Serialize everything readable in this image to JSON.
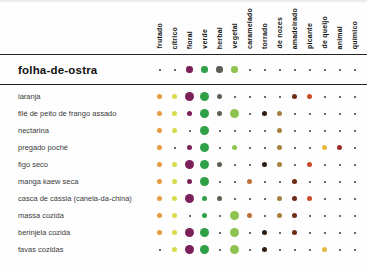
{
  "chart_data": {
    "type": "heatmap",
    "title": "folha-de-ostra",
    "legend_note": "dot size = flavor intensity",
    "size_legend": {
      "t": "trace",
      "s": "present",
      "m": "moderate",
      "l": "strong"
    },
    "dot_scale_px": {
      "t": 2,
      "s": 5,
      "m": 6.5,
      "l": 9
    },
    "trace_color": "#3a3a3a",
    "columns": [
      {
        "label": "frutado",
        "color": "#E79A3F"
      },
      {
        "label": "cítrico",
        "color": "#D9DB4B"
      },
      {
        "label": "floral",
        "color": "#7B2058"
      },
      {
        "label": "verde",
        "color": "#2FA047"
      },
      {
        "label": "herbal",
        "color": "#5E5E55"
      },
      {
        "label": "vegetal",
        "color": "#8FC350"
      },
      {
        "label": "caramelado",
        "color": "#C06F38"
      },
      {
        "label": "torrado",
        "color": "#2E1D12"
      },
      {
        "label": "de nozes",
        "color": "#A6803E"
      },
      {
        "label": "amadeirado",
        "color": "#6E2B16"
      },
      {
        "label": "picante",
        "color": "#C94B27"
      },
      {
        "label": "de queijo",
        "color": "#E6B83F"
      },
      {
        "label": "animal",
        "color": "#9E2B2B"
      },
      {
        "label": "químico",
        "color": "#4A4A4A"
      }
    ],
    "header_row": {
      "label": "folha-de-ostra",
      "cells": [
        "t",
        "t",
        "m",
        "m",
        "m",
        "m",
        "t",
        "t",
        "t",
        "t",
        "t",
        "t",
        "t",
        "t"
      ]
    },
    "rows": [
      {
        "label": "laranja",
        "cells": [
          "s",
          "s",
          "l",
          "l",
          "s",
          "t",
          "t",
          "t",
          "t",
          "s",
          "s",
          "t",
          "t",
          "t"
        ]
      },
      {
        "label": "filé de peito de frango assado",
        "cells": [
          "s",
          "s",
          "s",
          "l",
          "s",
          "l",
          "t",
          "s",
          "s",
          "t",
          "t",
          "t",
          "t",
          "t"
        ]
      },
      {
        "label": "nectarina",
        "cells": [
          "s",
          "s",
          "t",
          "l",
          "t",
          "t",
          "t",
          "t",
          "s",
          "t",
          "t",
          "t",
          "t",
          "t"
        ]
      },
      {
        "label": "pregado poché",
        "cells": [
          "s",
          "t",
          "s",
          "l",
          "t",
          "s",
          "t",
          "t",
          "s",
          "t",
          "t",
          "s",
          "s",
          "t"
        ]
      },
      {
        "label": "figo seco",
        "cells": [
          "s",
          "s",
          "l",
          "l",
          "s",
          "t",
          "t",
          "s",
          "s",
          "t",
          "s",
          "t",
          "t",
          "t"
        ]
      },
      {
        "label": "manga kaew seca",
        "cells": [
          "s",
          "s",
          "s",
          "l",
          "t",
          "t",
          "s",
          "t",
          "t",
          "s",
          "t",
          "t",
          "t",
          "t"
        ]
      },
      {
        "label": "casca de cássia (canela-da-china)",
        "cells": [
          "s",
          "s",
          "l",
          "s",
          "s",
          "t",
          "t",
          "t",
          "s",
          "s",
          "s",
          "t",
          "t",
          "t"
        ]
      },
      {
        "label": "massa cozida",
        "cells": [
          "s",
          "s",
          "t",
          "s",
          "t",
          "l",
          "s",
          "t",
          "s",
          "s",
          "t",
          "t",
          "t",
          "t"
        ]
      },
      {
        "label": "berinjela cozida",
        "cells": [
          "s",
          "s",
          "l",
          "l",
          "t",
          "l",
          "t",
          "s",
          "t",
          "s",
          "t",
          "t",
          "t",
          "t"
        ]
      },
      {
        "label": "favas cozidas",
        "cells": [
          "t",
          "s",
          "l",
          "l",
          "t",
          "l",
          "t",
          "s",
          "t",
          "t",
          "t",
          "s",
          "t",
          "t"
        ]
      }
    ]
  }
}
